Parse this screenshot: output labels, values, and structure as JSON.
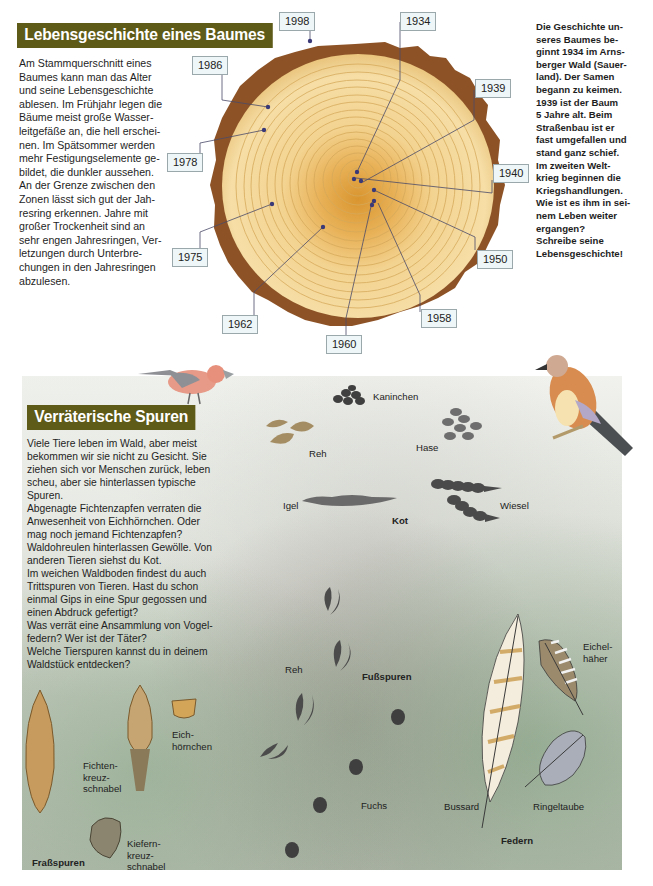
{
  "section1": {
    "title": "Lebensgeschichte eines Baumes",
    "body_lines": [
      "Am Stammquerschnitt eines",
      "Baumes kann man das Alter",
      "und seine Lebensgeschichte",
      "ablesen. Im Frühjahr legen die",
      "Bäume meist große Wasser-",
      "leitgefäße an, die hell erschei-",
      "nen. Im Spätsommer werden",
      "mehr Festigungselemente ge-",
      "bildet, die dunkler aussehen.",
      "An der Grenze zwischen den",
      "Zonen lässt sich gut der Jah-",
      "resring erkennen. Jahre mit",
      "großer Trockenheit sind an",
      "sehr engen Jahresringen, Ver-",
      "letzungen durch Unterbre-",
      "chungen in den Jahresringen",
      "abzulesen."
    ],
    "side_lines": [
      "Die Geschichte un-",
      "seres Baumes be-",
      "ginnt 1934 im Arns-",
      "berger Wald (Sauer-",
      "land). Der Samen",
      "begann zu keimen.",
      "1939 ist der Baum",
      "5 Jahre alt. Beim",
      "Straßenbau ist er",
      "fast umgefallen und",
      "stand ganz schief.",
      "Im zweiten Welt-",
      "krieg beginnen die",
      "Kriegshandlungen.",
      "Wie ist es ihm in sei-",
      "nem Leben weiter",
      "ergangen?",
      "Schreibe seine",
      "Lebensgeschichte!"
    ],
    "tree_ring_labels": [
      {
        "year": "1998"
      },
      {
        "year": "1934"
      },
      {
        "year": "1986"
      },
      {
        "year": "1939"
      },
      {
        "year": "1978"
      },
      {
        "year": "1940"
      },
      {
        "year": "1975"
      },
      {
        "year": "1950"
      },
      {
        "year": "1962"
      },
      {
        "year": "1958"
      },
      {
        "year": "1960"
      }
    ]
  },
  "section2": {
    "title": "Verräterische Spuren",
    "body_lines": [
      "Viele Tiere leben im Wald, aber meist",
      "bekommen wir sie nicht zu Gesicht. Sie",
      "ziehen sich vor Menschen zurück, leben",
      "scheu, aber sie hinterlassen typische",
      "Spuren.",
      "Abgenagte Fichtenzapfen verraten die",
      "Anwesenheit von Eichhörnchen. Oder",
      "mag noch jemand Fichtenzapfen?",
      "Waldohreulen hinterlassen Gewölle. Von",
      "anderen Tieren siehst du Kot.",
      "Im weichen Waldboden findest du auch",
      "Trittspuren von Tieren. Hast du schon",
      "einmal Gips in eine Spur gegossen und",
      "einen Abdruck gefertigt?",
      "Was verrät eine Ansammlung von Vogel-",
      "federn? Wer ist der Täter?",
      "Welche Tierspuren kannst du in deinem",
      "Waldstück entdecken?"
    ],
    "kot": {
      "heading": "Kot",
      "labels": {
        "kaninchen": "Kaninchen",
        "reh": "Reh",
        "hase": "Hase",
        "igel": "Igel",
        "wiesel": "Wiesel"
      }
    },
    "fussspuren": {
      "heading": "Fußspuren",
      "labels": {
        "reh": "Reh",
        "fuchs": "Fuchs"
      }
    },
    "frassspuren": {
      "heading": "Fraßspuren",
      "labels": {
        "eichhoernchen": [
          "Eich-",
          "hörnchen"
        ],
        "fichtenkreuzschnabel": [
          "Fichten-",
          "kreuz-",
          "schnabel"
        ],
        "kiefernkreuzschnabel": [
          "Kiefern-",
          "kreuz-",
          "schnabel"
        ]
      }
    },
    "federn": {
      "heading": "Federn",
      "labels": {
        "bussard": "Bussard",
        "ringeltaube": "Ringeltaube",
        "eichelhaeher": [
          "Eichel-",
          "häher"
        ]
      }
    }
  },
  "colors": {
    "title_bar": "#5e5a17",
    "year_box_bg": "#eef6f7",
    "wood_light": "#f2d79a",
    "bark": "#8a4f22"
  }
}
